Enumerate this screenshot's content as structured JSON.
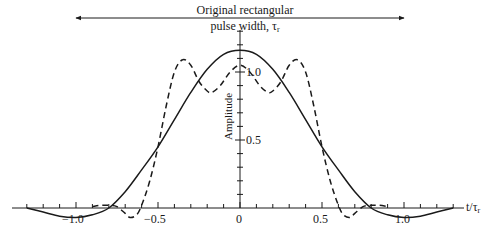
{
  "chart_data": {
    "type": "line",
    "annotation": {
      "line1": "Original rectangular",
      "line2": "pulse width, τ",
      "line2_sub": "r",
      "arrow_from": -1.0,
      "arrow_to": 1.0
    },
    "xlabel": "t/τ",
    "xlabel_sub": "r",
    "ylabel": "Amplitude",
    "xlim": [
      -1.3,
      1.3
    ],
    "ylim": [
      -0.1,
      1.25
    ],
    "x_ticks": [
      -1.0,
      -0.5,
      0,
      0.5,
      1.0
    ],
    "x_tick_labels": [
      "−1.0",
      "−0.5",
      "0",
      "0.5",
      "1.0"
    ],
    "y_ticks": [
      0.5,
      1.0
    ],
    "y_tick_labels": [
      "0.5",
      "1.0"
    ],
    "grid": false,
    "legend": "none",
    "series": [
      {
        "name": "solid",
        "style": "solid",
        "x": [
          -1.3,
          -1.2,
          -1.1,
          -1.0,
          -0.9,
          -0.8,
          -0.7,
          -0.6,
          -0.5,
          -0.4,
          -0.3,
          -0.2,
          -0.1,
          0,
          0.1,
          0.2,
          0.3,
          0.4,
          0.5,
          0.6,
          0.7,
          0.8,
          0.9,
          1.0,
          1.1,
          1.2,
          1.3
        ],
        "values": [
          0.0,
          -0.03,
          -0.06,
          -0.07,
          -0.05,
          0.0,
          0.12,
          0.28,
          0.45,
          0.65,
          0.85,
          1.02,
          1.13,
          1.16,
          1.13,
          1.02,
          0.85,
          0.65,
          0.45,
          0.28,
          0.12,
          0.0,
          -0.05,
          -0.07,
          -0.06,
          -0.03,
          0.0
        ]
      },
      {
        "name": "dashed",
        "style": "dashed",
        "x": [
          -0.9,
          -0.85,
          -0.8,
          -0.75,
          -0.7,
          -0.67,
          -0.63,
          -0.6,
          -0.55,
          -0.5,
          -0.45,
          -0.4,
          -0.35,
          -0.3,
          -0.25,
          -0.2,
          -0.17,
          -0.12,
          -0.06,
          0,
          0.06,
          0.12,
          0.17,
          0.2,
          0.25,
          0.3,
          0.35,
          0.4,
          0.45,
          0.5,
          0.55,
          0.6,
          0.63,
          0.67,
          0.7,
          0.75,
          0.8,
          0.85,
          0.9
        ],
        "values": [
          0.01,
          0.02,
          0.02,
          0.01,
          -0.04,
          -0.07,
          -0.05,
          0.02,
          0.2,
          0.45,
          0.75,
          1.0,
          1.09,
          1.05,
          0.93,
          0.86,
          0.85,
          0.9,
          1.0,
          1.05,
          1.0,
          0.9,
          0.85,
          0.86,
          0.93,
          1.05,
          1.09,
          1.0,
          0.75,
          0.45,
          0.2,
          0.02,
          -0.05,
          -0.07,
          -0.04,
          0.01,
          0.02,
          0.02,
          0.01
        ]
      }
    ]
  }
}
